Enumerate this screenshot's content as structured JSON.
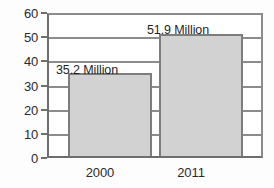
{
  "chart_data": {
    "type": "bar",
    "title": "",
    "subtitle": "",
    "xlabel": "",
    "ylabel": "",
    "categories": [
      "2000",
      "2011"
    ],
    "values": [
      35.2,
      51.9
    ],
    "data_labels": [
      "35.2 Million",
      "51.9 Million"
    ],
    "ylim": [
      0,
      60
    ],
    "ytick_labels": [
      "0",
      "10",
      "20",
      "30",
      "40",
      "50",
      "60"
    ],
    "ytick_values": [
      0,
      10,
      20,
      30,
      40,
      50,
      60
    ],
    "grid": true,
    "legend": "none",
    "colors": {
      "bar_fill": "#d2d2d2",
      "bar_border": "#7d7d7d",
      "gridline": "#8c8c8c",
      "axis": "#6e6e6e",
      "text": "#2b2b2b",
      "background": "#ffffff"
    }
  }
}
